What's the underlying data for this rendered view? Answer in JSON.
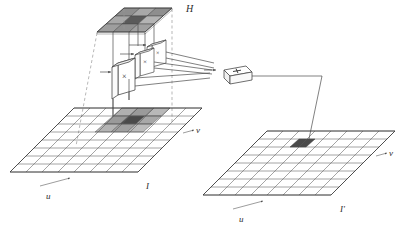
{
  "figure": {
    "type": "convolution-diagram"
  },
  "kernel": {
    "name": "H",
    "label": "H",
    "rows": 3,
    "cols": 3,
    "cells": [
      [
        "#8e8e8e",
        "#a8a8a8",
        "#8e8e8e"
      ],
      [
        "#a8a8a8",
        "#5a5a5a",
        "#b4b4b4"
      ],
      [
        "#9e9e9e",
        "#8e8e8e",
        "#a0a0a0"
      ]
    ]
  },
  "input_image": {
    "name": "I",
    "label": "I",
    "axis_u": "u",
    "axis_v": "v",
    "rows": 8,
    "cols": 8,
    "highlight": {
      "rows": 3,
      "cols": 3,
      "cells": [
        [
          "#b0b0b0",
          "#9a9a9a",
          "#b8b8b8"
        ],
        [
          "#9a9a9a",
          "#4a4a4a",
          "#a8a8a8"
        ],
        [
          "#b4b4b4",
          "#a0a0a0",
          "#bcbcbc"
        ]
      ]
    }
  },
  "output_image": {
    "name": "I'",
    "label": "I'",
    "axis_u": "u",
    "axis_v": "v",
    "rows": 8,
    "cols": 8,
    "highlight_color": "#4a4a4a"
  },
  "operators": {
    "multipliers": [
      {
        "symbol": "×",
        "name": "multiplier-1"
      },
      {
        "symbol": "×",
        "name": "multiplier-2"
      },
      {
        "symbol": "×",
        "name": "multiplier-3"
      }
    ],
    "adder": {
      "symbol": "+",
      "name": "adder"
    }
  },
  "colors": {
    "stroke": "#4a4a4a",
    "dashed": "#8c8c8c",
    "box_fill": "#ffffff",
    "background": "#ffffff"
  }
}
